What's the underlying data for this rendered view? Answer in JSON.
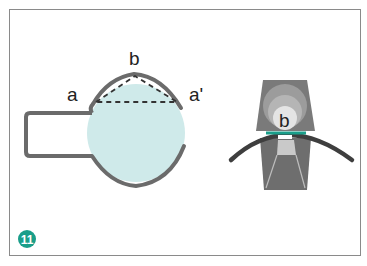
{
  "figure": {
    "number": "11",
    "badge_color": "#1a9e8a",
    "left_diagram": {
      "labels": {
        "a": "a",
        "b": "b",
        "a_prime": "a'"
      },
      "fill_color": "#cfeaea",
      "stroke_color": "#6b6b6b"
    },
    "right_diagram": {
      "labels": {
        "b": "b"
      },
      "accent_color": "#1a9e8a",
      "arc_color": "#3e3e3e"
    }
  }
}
